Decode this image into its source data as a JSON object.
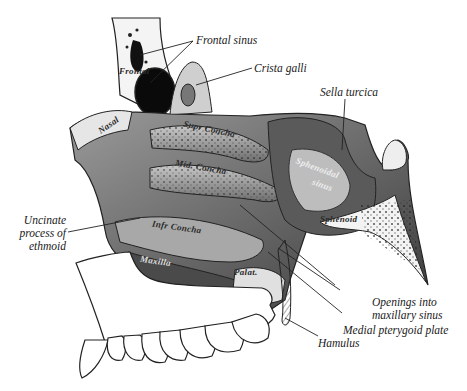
{
  "figure": {
    "background": "#ffffff",
    "ink_color": "#1a1a1a",
    "callouts": [
      {
        "id": "frontal-sinus",
        "text": "Frontal sinus"
      },
      {
        "id": "crista-galli",
        "text": "Crista galli"
      },
      {
        "id": "sella-turcica",
        "text": "Sella turcica"
      },
      {
        "id": "uncinate-process",
        "lines": [
          "Uncinate",
          "process of",
          "ethmoid"
        ]
      },
      {
        "id": "openings-maxillary",
        "lines": [
          "Openings into",
          "maxillary sinus"
        ]
      },
      {
        "id": "medial-pterygoid",
        "text": "Medial pterygoid plate"
      },
      {
        "id": "hamulus",
        "text": "Hamulus"
      }
    ],
    "bone_labels": {
      "frontal": "Frontal",
      "nasal": "Nasal",
      "supr_concha": "Supr Concha",
      "mid_concha": "Mid. Concha",
      "infr_concha": "Infr Concha",
      "maxilla": "Maxilla",
      "palat": "Palat.",
      "sphenoidal_sinus_1": "Sphenoidal",
      "sphenoidal_sinus_2": "sinus",
      "sphenoid": "Sphenoid"
    }
  }
}
